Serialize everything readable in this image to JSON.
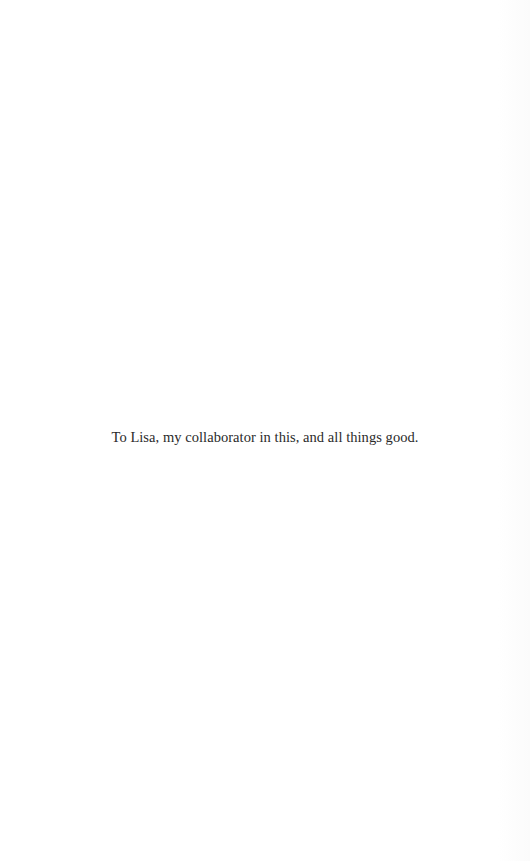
{
  "page": {
    "dedication": "To Lisa, my collaborator in this, and all things good.",
    "colors": {
      "background": "#ffffff",
      "text": "#2a2a2a"
    }
  }
}
